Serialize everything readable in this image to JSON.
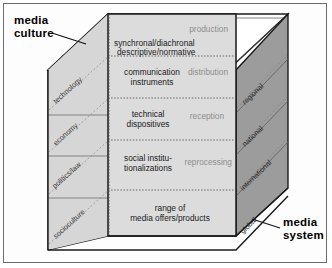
{
  "diagram": {
    "callouts": [
      {
        "id": "media-culture",
        "text": "media\nculture"
      },
      {
        "id": "media-system",
        "text": "media\nsystem"
      }
    ],
    "front_face": {
      "rows": [
        {
          "aspect_lines": [
            "synchronal/diachronal",
            "descriptive/normative"
          ],
          "process": "production",
          "align": "left"
        },
        {
          "aspect_lines": [
            "communication",
            "instruments"
          ],
          "process": "distribution",
          "align": "center"
        },
        {
          "aspect_lines": [
            "technical",
            "dispositives"
          ],
          "process": "reception",
          "align": "center"
        },
        {
          "aspect_lines": [
            "social institu-",
            "tionalizations"
          ],
          "process": "reprocessing",
          "align": "center"
        },
        {
          "aspect_lines": [
            "range of",
            "media offers/products"
          ],
          "process": "",
          "align": "center"
        }
      ]
    },
    "left_face": {
      "labels": [
        "technology",
        "economy",
        "politics/law",
        "socioculture"
      ]
    },
    "right_face": {
      "labels": [
        "regional",
        "national",
        "international",
        "global"
      ]
    },
    "colors": {
      "front": "#dcdcdc",
      "left": "#d2d2d2",
      "top": "#ffffff",
      "right": "#9c9c9c",
      "outline": "#1a1a1a",
      "divider": "#6f6f6f",
      "process_text": "#8d8d8d",
      "frame": "#6b6b6b"
    }
  }
}
